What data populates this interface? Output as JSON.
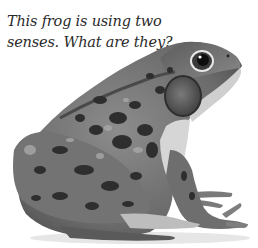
{
  "caption": {
    "line1": "This frog is using two",
    "line2": "senses. What are they?"
  },
  "image": {
    "subject": "frog",
    "style": "grayscale photograph",
    "background": "#ffffff"
  },
  "colors": {
    "text": "#2a2a2a",
    "frog_light": "#9a9a9a",
    "frog_mid": "#6e6e6e",
    "frog_dark": "#2e2e2e",
    "frog_belly": "#d6d6d6"
  }
}
